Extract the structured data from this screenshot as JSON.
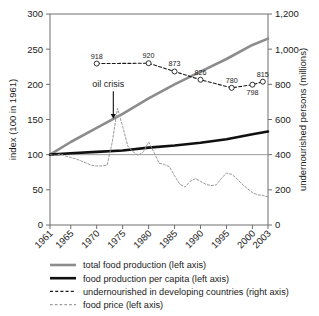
{
  "chart_data": {
    "type": "line",
    "title": "",
    "xlabel": "",
    "ylabel": "index (100 in 1961)",
    "y2label": "undernourished persons (millions)",
    "xlim": [
      1961,
      2003
    ],
    "ylim": [
      0,
      300
    ],
    "y2lim": [
      0,
      1200
    ],
    "yticks": [
      "0",
      "50",
      "100",
      "150",
      "200",
      "250",
      "300"
    ],
    "ytick_values": [
      0,
      50,
      100,
      150,
      200,
      250,
      300
    ],
    "y2ticks": [
      "0",
      "200",
      "400",
      "600",
      "800",
      "1,000",
      "1,200"
    ],
    "y2tick_values": [
      0,
      200,
      400,
      600,
      800,
      1000,
      1200
    ],
    "xticks": [
      "1961",
      "1965",
      "1970",
      "1975",
      "1980",
      "1985",
      "1990",
      "1995",
      "2000",
      "2003"
    ],
    "xtick_values": [
      1961,
      1965,
      1970,
      1975,
      1980,
      1985,
      1990,
      1995,
      2000,
      2003
    ],
    "grid": false,
    "legend_position": "below",
    "annotations": [
      {
        "text": "oil crisis",
        "x": 1972.2,
        "y": 196,
        "arrow_to_x": 1973.2,
        "arrow_to_y": 152
      }
    ],
    "series": [
      {
        "name": "total food production (left axis)",
        "axis": "left",
        "style": "solid",
        "color": "#8c8c8c",
        "width": 2.6,
        "x": [
          1961,
          1965,
          1970,
          1975,
          1980,
          1985,
          1990,
          1995,
          2000,
          2003
        ],
        "values": [
          100,
          118,
          138,
          158,
          180,
          200,
          218,
          236,
          256,
          265
        ]
      },
      {
        "name": "food production per capita (left axis)",
        "axis": "left",
        "style": "solid",
        "color": "#101010",
        "width": 2.6,
        "x": [
          1961,
          1965,
          1970,
          1975,
          1980,
          1985,
          1990,
          1995,
          2000,
          2003
        ],
        "values": [
          100,
          102,
          104,
          106,
          110,
          113,
          117,
          122,
          129,
          133
        ]
      },
      {
        "name": "undernourished in developing countries (right axis)",
        "axis": "right",
        "style": "dashed",
        "color": "#1a1a1a",
        "width": 1.1,
        "marker": "open-circle",
        "x": [
          1970,
          1980,
          1985,
          1990,
          1996,
          2000,
          2002
        ],
        "values": [
          918,
          920,
          873,
          826,
          780,
          798,
          815
        ],
        "labels": [
          "918",
          "920",
          "873",
          "826",
          "780",
          "798",
          "815"
        ],
        "label_pos": [
          "above",
          "above",
          "above",
          "above",
          "above",
          "below",
          "above"
        ]
      },
      {
        "name": "food price (left axis)",
        "axis": "left",
        "style": "dashed",
        "color": "#9a9a9a",
        "width": 1.0,
        "x": [
          1961,
          1962,
          1963,
          1964,
          1965,
          1966,
          1967,
          1968,
          1969,
          1970,
          1971,
          1972,
          1973,
          1974,
          1975,
          1976,
          1977,
          1978,
          1979,
          1980,
          1981,
          1982,
          1983,
          1984,
          1985,
          1986,
          1987,
          1988,
          1989,
          1990,
          1991,
          1992,
          1993,
          1994,
          1995,
          1996,
          1997,
          1998,
          1999,
          2000,
          2001,
          2002,
          2003
        ],
        "values": [
          100,
          99,
          101,
          98,
          96,
          94,
          91,
          88,
          85,
          84,
          84,
          85,
          118,
          166,
          140,
          112,
          104,
          99,
          104,
          118,
          104,
          88,
          86,
          83,
          70,
          58,
          54,
          62,
          66,
          62,
          58,
          56,
          57,
          66,
          74,
          72,
          66,
          58,
          52,
          46,
          43,
          42,
          40
        ]
      }
    ]
  },
  "legend": {
    "items": [
      {
        "label": "total food production (left axis)",
        "style": "solid",
        "color": "#8c8c8c",
        "width": 2.6
      },
      {
        "label": "food production per capita (left axis)",
        "style": "solid",
        "color": "#101010",
        "width": 2.6
      },
      {
        "label": "undernourished in developing countries (right axis)",
        "style": "dashed",
        "color": "#1a1a1a",
        "width": 1.2
      },
      {
        "label": "food price (left axis)",
        "style": "dashed",
        "color": "#9a9a9a",
        "width": 1.1
      }
    ]
  }
}
